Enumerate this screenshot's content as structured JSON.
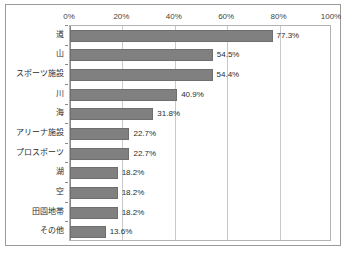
{
  "chart_data": {
    "type": "bar",
    "orientation": "horizontal",
    "title": "",
    "xlabel": "",
    "ylabel": "",
    "xlim": [
      0,
      100
    ],
    "grid": true,
    "legend": false,
    "x_tick_labels": [
      "0%",
      "20%",
      "40%",
      "60%",
      "80%",
      "100%"
    ],
    "x_ticks": [
      0,
      20,
      40,
      60,
      80,
      100
    ],
    "categories": [
      "道",
      "山",
      "スポーツ施設",
      "川",
      "海",
      "アリーナ施設",
      "プロスポーツ",
      "湖",
      "空",
      "田園地帯",
      "その他"
    ],
    "values": [
      77.3,
      54.5,
      54.4,
      40.9,
      31.8,
      22.7,
      22.7,
      18.2,
      18.2,
      18.2,
      13.6
    ],
    "data_labels": [
      "77.3%",
      "54.5%",
      "54.4%",
      "40.9%",
      "31.8%",
      "22.7%",
      "22.7%",
      "18.2%",
      "18.2%",
      "18.2%",
      "13.6%"
    ],
    "bar_color": "#808080",
    "bar_border_color": "#6e6e6e",
    "gridline_color": "#c9c9c9",
    "plot_border_color": "#b3b3b3",
    "frame_border_color": "#9a9a9a",
    "background_color": "#ffffff"
  }
}
